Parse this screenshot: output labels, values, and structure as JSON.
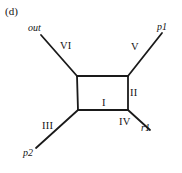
{
  "figure": {
    "panel_tag": "(d)",
    "background_color": "#ffffff",
    "line_color": "#1a1a1a",
    "width": 182,
    "height": 173
  },
  "diagram": {
    "type": "box-diagram",
    "box": {
      "name": "central-square",
      "top_left": [
        77,
        76
      ],
      "top_right": [
        128,
        76
      ],
      "bottom_right": [
        128,
        110
      ],
      "bottom_left": [
        78,
        110
      ]
    },
    "external_legs": [
      {
        "id": "leg-out",
        "label": "out",
        "edge_label": "VI",
        "from": [
          77,
          76
        ],
        "to": [
          41,
          35
        ],
        "label_x": 28,
        "label_y": 23,
        "edge_label_x": 60,
        "edge_label_y": 41
      },
      {
        "id": "leg-p1",
        "label": "p1",
        "edge_label": "V",
        "from": [
          128,
          76
        ],
        "to": [
          162,
          33
        ],
        "label_x": 157,
        "label_y": 22,
        "edge_label_x": 131,
        "edge_label_y": 42
      },
      {
        "id": "leg-r1",
        "label": "r1",
        "edge_label": "IV",
        "from": [
          128,
          110
        ],
        "to": [
          150,
          130
        ],
        "label_x": 141,
        "label_y": 123,
        "edge_label_x": 119,
        "edge_label_y": 117
      },
      {
        "id": "leg-p2",
        "label": "p2",
        "edge_label": "III",
        "from": [
          78,
          110
        ],
        "to": [
          36,
          148
        ],
        "label_x": 23,
        "label_y": 148,
        "edge_label_x": 42,
        "edge_label_y": 121
      }
    ],
    "internal_edge_labels": [
      {
        "id": "edge-I",
        "label": "I",
        "label_x": 102,
        "label_y": 98,
        "edge": "bottom"
      },
      {
        "id": "edge-II",
        "label": "II",
        "label_x": 130,
        "label_y": 88,
        "edge": "right"
      }
    ]
  }
}
